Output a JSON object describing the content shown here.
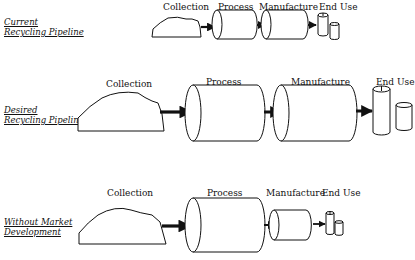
{
  "diagram": {
    "rows": [
      {
        "id": "current",
        "label_line1": "Current",
        "label_line2": "Recycling Pipeline",
        "stages": {
          "collection": "Collection",
          "process": "Process",
          "manufacture": "Manufacture",
          "end_use": "End Use"
        }
      },
      {
        "id": "desired",
        "label_line1": "Desired",
        "label_line2": "Recycling Pipeline",
        "stages": {
          "collection": "Collection",
          "process": "Process",
          "manufacture": "Manufacture",
          "end_use": "End Use"
        }
      },
      {
        "id": "without-market",
        "label_line1": "Without Market",
        "label_line2": "Development",
        "stages": {
          "collection": "Collection",
          "process": "Process",
          "manufacture": "Manufacture",
          "end_use": "End Use"
        }
      }
    ],
    "colors": {
      "stroke": "#111111",
      "fill": "#ffffff"
    }
  }
}
